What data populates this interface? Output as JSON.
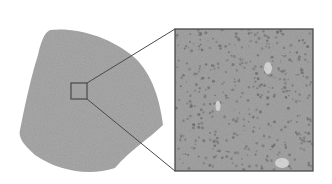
{
  "figure": {
    "colors": {
      "background": "#ffffff",
      "sample_fill": "#a9a9a9",
      "inset_fill": "#a4a4a4",
      "outline": "#4a4a4a",
      "speckle_dark": "#6f6f6f",
      "highlight_blob": "#d8d8d8"
    },
    "sample_shape": {
      "path": "M50,30 C75,27 110,36 135,58 C152,74 160,100 163,125 C150,138 130,150 115,168 C90,176 60,172 35,155 C24,145 18,138 20,130 C24,110 30,80 38,55 C41,42 44,33 50,30 Z"
    },
    "selection_box": {
      "x": 71,
      "y": 83,
      "width": 16,
      "height": 16
    },
    "inset": {
      "x": 175,
      "y": 29,
      "width": 138,
      "height": 142
    },
    "connector_lines": [
      {
        "x1": 87,
        "y1": 83,
        "x2": 175,
        "y2": 29
      },
      {
        "x1": 87,
        "y1": 99,
        "x2": 175,
        "y2": 171
      }
    ],
    "inset_highlights": [
      {
        "cx": 268,
        "cy": 68,
        "rx": 4,
        "ry": 6
      },
      {
        "cx": 218,
        "cy": 106,
        "rx": 2.5,
        "ry": 5
      },
      {
        "cx": 282,
        "cy": 163,
        "rx": 7,
        "ry": 5
      }
    ]
  }
}
